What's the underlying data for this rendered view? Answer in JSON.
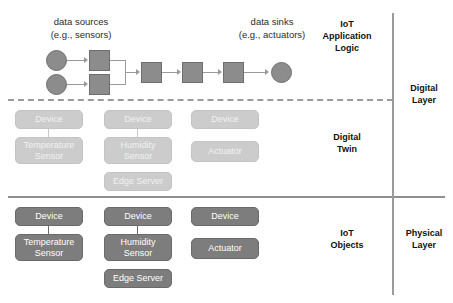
{
  "diagram": {
    "captions": {
      "data_sources_line1": "data sources",
      "data_sources_line2": "(e.g., sensors)",
      "data_sinks_line1": "data sinks",
      "data_sinks_line2": "(e.g., actuators)"
    },
    "tier_labels": {
      "application_logic_line1": "IoT",
      "application_logic_line2": "Application",
      "application_logic_line3": "Logic",
      "digital_twin_line1": "Digital",
      "digital_twin_line2": "Twin",
      "iot_objects_line1": "IoT",
      "iot_objects_line2": "Objects"
    },
    "layer_labels": {
      "digital_layer_line1": "Digital",
      "digital_layer_line2": "Layer",
      "physical_layer_line1": "Physical",
      "physical_layer_line2": "Layer"
    },
    "flow": {
      "sources": [
        "source-1",
        "source-2"
      ],
      "processors": [
        "proc-1",
        "proc-2",
        "proc-3",
        "proc-4",
        "proc-5"
      ],
      "sinks": [
        "sink-1"
      ]
    },
    "digital_twin_boxes": {
      "col1_device": "Device",
      "col1_sensor_line1": "Temperature",
      "col1_sensor_line2": "Sensor",
      "col2_device": "Device",
      "col2_sensor_line1": "Humidity",
      "col2_sensor_line2": "Sensor",
      "col2_edge": "Edge Server",
      "col3_device": "Device",
      "col3_actuator": "Actuator"
    },
    "physical_boxes": {
      "col1_device": "Device",
      "col1_sensor_line1": "Temperature",
      "col1_sensor_line2": "Sensor",
      "col2_device": "Device",
      "col2_sensor_line1": "Humidity",
      "col2_sensor_line2": "Sensor",
      "col2_edge": "Edge Server",
      "col3_device": "Device",
      "col3_actuator": "Actuator"
    },
    "colors": {
      "node_fill": "#8c8c8c",
      "physical_box": "#7d7d7d",
      "twin_box": "#cccccc",
      "divider": "#9b9b9b",
      "text": "#111111"
    }
  }
}
